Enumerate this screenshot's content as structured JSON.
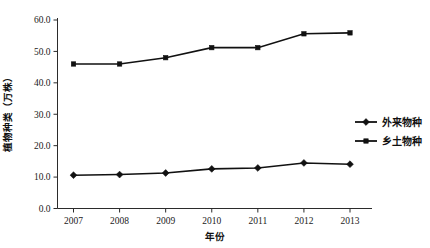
{
  "chart_data": {
    "type": "line",
    "title": "",
    "xlabel": "年份",
    "ylabel": "植物种类（万株）",
    "categories": [
      "2007",
      "2008",
      "2009",
      "2010",
      "2011",
      "2012",
      "2013"
    ],
    "ylim": [
      0.0,
      60.0
    ],
    "ytick_labels": [
      "0.0",
      "10.0",
      "20.0",
      "30.0",
      "40.0",
      "50.0",
      "60.0"
    ],
    "ytick_values": [
      0.0,
      10.0,
      20.0,
      30.0,
      40.0,
      50.0,
      60.0
    ],
    "grid": false,
    "legend_position": "right-middle",
    "series": [
      {
        "name": "外来物种",
        "marker": "diamond",
        "color": "#111111",
        "values": [
          10.6,
          10.8,
          11.3,
          12.6,
          12.9,
          14.5,
          14.1
        ]
      },
      {
        "name": "乡土物种",
        "marker": "square",
        "color": "#111111",
        "values": [
          46.0,
          46.0,
          48.0,
          51.2,
          51.2,
          55.6,
          55.9
        ]
      }
    ]
  },
  "axis": {
    "y_title": "植物种类（万株）",
    "x_title": "年份"
  },
  "legend": {
    "entries": [
      {
        "label": "外来物种",
        "marker": "diamond"
      },
      {
        "label": "乡土物种",
        "marker": "square"
      }
    ]
  }
}
